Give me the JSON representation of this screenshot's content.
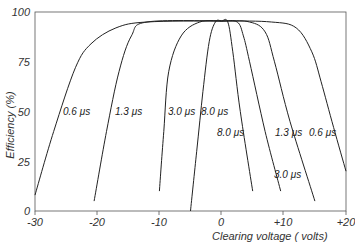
{
  "chart_data": {
    "type": "line",
    "title": "",
    "xlabel": "Clearing voltage ( volts)",
    "ylabel": "Efficiency (%)",
    "xlim": [
      -30,
      20
    ],
    "ylim": [
      0,
      100
    ],
    "grid": false,
    "legend": "inline labels on curves",
    "x_ticks": [
      "-30",
      "-20",
      "-10",
      "0",
      "+10",
      "+20"
    ],
    "x_tick_values": [
      -30,
      -20,
      -10,
      0,
      10,
      20
    ],
    "y_ticks": [
      "0",
      "25",
      "50",
      "75",
      "100"
    ],
    "y_tick_values": [
      0,
      25,
      50,
      75,
      100
    ],
    "series": [
      {
        "name": "0.6 μs",
        "label": "0.6 μs",
        "points": [
          [
            -30,
            8
          ],
          [
            -27,
            40
          ],
          [
            -23.5,
            72
          ],
          [
            -21,
            84
          ],
          [
            -17,
            92
          ],
          [
            -12,
            95
          ],
          [
            0,
            95.5
          ],
          [
            8,
            95
          ],
          [
            12,
            92
          ],
          [
            14.5,
            80
          ],
          [
            16,
            65
          ],
          [
            18,
            42
          ],
          [
            20,
            20
          ]
        ]
      },
      {
        "name": "1.3 μs",
        "label": "1.3 μs",
        "points": [
          [
            -20.5,
            5
          ],
          [
            -18.5,
            40
          ],
          [
            -16.5,
            70
          ],
          [
            -14.5,
            88
          ],
          [
            -12,
            95
          ],
          [
            0,
            95.5
          ],
          [
            4.5,
            95
          ],
          [
            7,
            90
          ],
          [
            8.5,
            75
          ],
          [
            11,
            45
          ],
          [
            15,
            5
          ]
        ]
      },
      {
        "name": "3.0 μs",
        "label": "3.0 μs",
        "points": [
          [
            -10,
            10
          ],
          [
            -9.3,
            40
          ],
          [
            -8.5,
            70
          ],
          [
            -6.5,
            88
          ],
          [
            -3.5,
            95
          ],
          [
            0,
            95.5
          ],
          [
            2.5,
            95
          ],
          [
            3.5,
            88
          ],
          [
            4.5,
            75
          ],
          [
            7,
            40
          ],
          [
            9.5,
            10
          ]
        ]
      },
      {
        "name": "8.0 μs",
        "label": "8.0 μs",
        "points": [
          [
            -5,
            0
          ],
          [
            -4,
            30
          ],
          [
            -3,
            60
          ],
          [
            -2,
            85
          ],
          [
            -1,
            95
          ],
          [
            0,
            95.5
          ],
          [
            1,
            95
          ],
          [
            1.8,
            80
          ],
          [
            3,
            50
          ],
          [
            5,
            10
          ]
        ]
      }
    ],
    "annotations": [
      {
        "text": "0.6 μs",
        "x": -24,
        "y": 50
      },
      {
        "text": "1.3 μs",
        "x": -16.5,
        "y": 50
      },
      {
        "text": "3.0 μs",
        "x": -8,
        "y": 50
      },
      {
        "text": "8.0 μs",
        "x": -3,
        "y": 50
      },
      {
        "text": "8.0 μs",
        "x": 0,
        "y": 42
      },
      {
        "text": "1.3 μs",
        "x": 8.5,
        "y": 42
      },
      {
        "text": "0.6 μs",
        "x": 14.5,
        "y": 42
      },
      {
        "text": "3.0 μs",
        "x": 4.5,
        "y": 20
      }
    ]
  },
  "axes": {
    "xlabel": "Clearing voltage ( volts)",
    "ylabel": "Efficiency (%)",
    "x_ticks": [
      "-30",
      "-20",
      "-10",
      "0",
      "+10",
      "+20"
    ],
    "y_ticks": [
      "0",
      "25",
      "50",
      "75",
      "100"
    ]
  },
  "labels": [
    "0.6 μs",
    "1.3 μs",
    "3.0 μs",
    "8.0 μs",
    "8.0 μs",
    "1.3 μs",
    "0.6 μs",
    "3.0 μs"
  ]
}
